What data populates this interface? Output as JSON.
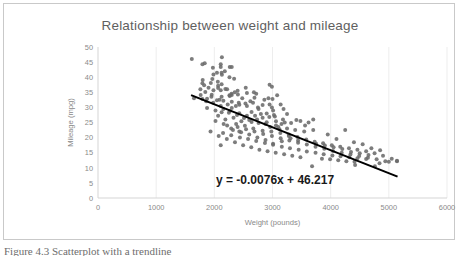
{
  "figure": {
    "caption_clipped": "Figure 4.3  Scatterplot with a trendline",
    "equation_label": "y = -0.0076x + 46.217"
  },
  "chart_data": {
    "type": "scatter",
    "title": "Relationship between weight and mileage",
    "xlabel": "Weight (pounds)",
    "ylabel": "Mileage (mpg)",
    "xlim": [
      0,
      6000
    ],
    "ylim": [
      0,
      50
    ],
    "xticks": [
      0,
      1000,
      2000,
      3000,
      4000,
      5000,
      6000
    ],
    "yticks": [
      0,
      5,
      10,
      15,
      20,
      25,
      30,
      35,
      40,
      45,
      50
    ],
    "grid": "vertical-only",
    "legend": "none",
    "marker_color": "#6b6b6b",
    "trendline": {
      "color": "#000000",
      "slope": -0.0076,
      "intercept": 46.217,
      "x_start": 1600,
      "x_end": 5150,
      "equation": "y = -0.0076x + 46.217"
    },
    "points": [
      [
        1613,
        46
      ],
      [
        2130,
        46.6
      ],
      [
        2110,
        44.3
      ],
      [
        1835,
        44.6
      ],
      [
        2110,
        43.4
      ],
      [
        1975,
        43.1
      ],
      [
        2265,
        43.4
      ],
      [
        1795,
        44.3
      ],
      [
        2045,
        41.5
      ],
      [
        2130,
        40.8
      ],
      [
        1985,
        40.9
      ],
      [
        2125,
        41.5
      ],
      [
        2300,
        43.4
      ],
      [
        1965,
        39.4
      ],
      [
        1800,
        39.1
      ],
      [
        1795,
        38.0
      ],
      [
        1825,
        37.3
      ],
      [
        1940,
        38.1
      ],
      [
        2065,
        37.2
      ],
      [
        2125,
        37.7
      ],
      [
        2190,
        36.1
      ],
      [
        2065,
        36.4
      ],
      [
        1985,
        35.7
      ],
      [
        1845,
        35.1
      ],
      [
        2110,
        35.7
      ],
      [
        2220,
        36.0
      ],
      [
        2295,
        34.5
      ],
      [
        2300,
        34.1
      ],
      [
        2350,
        35.0
      ],
      [
        2405,
        34.3
      ],
      [
        2265,
        33.8
      ],
      [
        2125,
        33.5
      ],
      [
        1955,
        34.2
      ],
      [
        1765,
        34.1
      ],
      [
        1650,
        33.0
      ],
      [
        1795,
        32.8
      ],
      [
        1875,
        32.9
      ],
      [
        2045,
        32.4
      ],
      [
        2155,
        32.2
      ],
      [
        2300,
        31.9
      ],
      [
        2420,
        31.5
      ],
      [
        2535,
        31.3
      ],
      [
        2665,
        31.5
      ],
      [
        2750,
        30.0
      ],
      [
        2560,
        30.5
      ],
      [
        2430,
        30.9
      ],
      [
        2300,
        29.8
      ],
      [
        2155,
        29.5
      ],
      [
        2020,
        29.0
      ],
      [
        1875,
        29.8
      ],
      [
        2125,
        28.4
      ],
      [
        2265,
        28.8
      ],
      [
        2430,
        28.1
      ],
      [
        2560,
        27.2
      ],
      [
        2700,
        27.2
      ],
      [
        2830,
        26.6
      ],
      [
        2945,
        26.8
      ],
      [
        3060,
        25.4
      ],
      [
        2900,
        25.1
      ],
      [
        2735,
        26.0
      ],
      [
        2600,
        25.8
      ],
      [
        2465,
        25.4
      ],
      [
        2330,
        26.6
      ],
      [
        2190,
        26.0
      ],
      [
        2065,
        27.2
      ],
      [
        2220,
        24.0
      ],
      [
        2375,
        24.5
      ],
      [
        2525,
        23.9
      ],
      [
        2670,
        23.0
      ],
      [
        2830,
        22.3
      ],
      [
        2980,
        22.0
      ],
      [
        3135,
        21.5
      ],
      [
        3280,
        21.0
      ],
      [
        3430,
        20.2
      ],
      [
        3580,
        19.4
      ],
      [
        3725,
        18.6
      ],
      [
        3870,
        18.1
      ],
      [
        4020,
        17.5
      ],
      [
        4165,
        17.0
      ],
      [
        4315,
        16.5
      ],
      [
        4460,
        16.0
      ],
      [
        4610,
        15.5
      ],
      [
        4755,
        14.8
      ],
      [
        4900,
        14.0
      ],
      [
        5050,
        13.0
      ],
      [
        5140,
        12.2
      ],
      [
        2400,
        23.5
      ],
      [
        2545,
        22.8
      ],
      [
        2690,
        22.0
      ],
      [
        2840,
        21.2
      ],
      [
        2990,
        20.5
      ],
      [
        3140,
        19.8
      ],
      [
        3290,
        19.0
      ],
      [
        3440,
        18.3
      ],
      [
        3590,
        17.7
      ],
      [
        3740,
        17.0
      ],
      [
        3890,
        16.3
      ],
      [
        4040,
        15.6
      ],
      [
        4190,
        15.0
      ],
      [
        4340,
        14.4
      ],
      [
        4490,
        13.9
      ],
      [
        4640,
        13.3
      ],
      [
        4790,
        12.8
      ],
      [
        4940,
        12.2
      ],
      [
        2990,
        30.0
      ],
      [
        3010,
        29.0
      ],
      [
        3025,
        27.5
      ],
      [
        2950,
        31.0
      ],
      [
        3155,
        24.5
      ],
      [
        3210,
        25.0
      ],
      [
        3060,
        24.0
      ],
      [
        3410,
        25.8
      ],
      [
        3620,
        25.0
      ],
      [
        3560,
        24.0
      ],
      [
        3700,
        22.5
      ],
      [
        3545,
        22.0
      ],
      [
        3390,
        22.5
      ],
      [
        3250,
        23.0
      ],
      [
        3100,
        23.5
      ],
      [
        2880,
        24.5
      ],
      [
        2760,
        24.8
      ],
      [
        2640,
        25.2
      ],
      [
        2510,
        26.5
      ],
      [
        2390,
        27.5
      ],
      [
        2250,
        28.2
      ],
      [
        2110,
        30.5
      ],
      [
        1980,
        31.5
      ],
      [
        1860,
        32.0
      ],
      [
        2150,
        21.5
      ],
      [
        2290,
        20.8
      ],
      [
        2440,
        20.0
      ],
      [
        2580,
        19.5
      ],
      [
        2720,
        18.9
      ],
      [
        2870,
        18.2
      ],
      [
        3010,
        17.6
      ],
      [
        3160,
        17.0
      ],
      [
        3300,
        16.5
      ],
      [
        3450,
        16.0
      ],
      [
        3590,
        15.4
      ],
      [
        3740,
        15.0
      ],
      [
        3880,
        14.5
      ],
      [
        4030,
        14.1
      ],
      [
        4170,
        13.8
      ],
      [
        4320,
        13.5
      ],
      [
        4460,
        13.2
      ],
      [
        4610,
        12.9
      ],
      [
        2110,
        17.5
      ],
      [
        3680,
        10.5
      ],
      [
        4420,
        10.9
      ],
      [
        4760,
        10.5
      ],
      [
        4840,
        11.5
      ],
      [
        5000,
        12.0
      ],
      [
        5140,
        12.3
      ],
      [
        3850,
        13.0
      ],
      [
        3990,
        12.8
      ],
      [
        4130,
        12.5
      ],
      [
        4270,
        12.2
      ],
      [
        4410,
        12.0
      ],
      [
        3480,
        13.5
      ],
      [
        3340,
        14.0
      ],
      [
        3200,
        14.5
      ],
      [
        3055,
        15.0
      ],
      [
        2915,
        15.5
      ],
      [
        2775,
        16.0
      ],
      [
        2635,
        16.8
      ],
      [
        2495,
        17.5
      ],
      [
        2355,
        18.5
      ],
      [
        2215,
        19.5
      ],
      [
        2075,
        20.5
      ],
      [
        1935,
        22.0
      ],
      [
        2480,
        33.0
      ],
      [
        2620,
        32.0
      ],
      [
        2760,
        29.5
      ],
      [
        2900,
        28.0
      ],
      [
        3040,
        27.0
      ],
      [
        3180,
        26.0
      ],
      [
        3320,
        24.8
      ],
      [
        2370,
        30.5
      ],
      [
        2230,
        31.0
      ],
      [
        2090,
        32.5
      ],
      [
        1950,
        33.5
      ],
      [
        2640,
        28.5
      ],
      [
        2800,
        27.8
      ],
      [
        2960,
        23.5
      ],
      [
        3120,
        22.8
      ],
      [
        3280,
        20.5
      ],
      [
        3440,
        19.0
      ],
      [
        2950,
        37.5
      ],
      [
        2990,
        36.8
      ],
      [
        2930,
        33.0
      ],
      [
        3140,
        31.0
      ],
      [
        3190,
        29.5
      ],
      [
        2430,
        22.0
      ],
      [
        2290,
        23.0
      ],
      [
        2160,
        24.5
      ],
      [
        2020,
        25.5
      ],
      [
        2260,
        34.0
      ],
      [
        2400,
        35.5
      ],
      [
        2560,
        34.8
      ],
      [
        2690,
        33.2
      ],
      [
        2830,
        30.8
      ],
      [
        3700,
        26.0
      ],
      [
        3480,
        25.5
      ],
      [
        4250,
        22.5
      ],
      [
        3950,
        21.0
      ],
      [
        4100,
        19.5
      ],
      [
        4400,
        18.5
      ],
      [
        4550,
        17.8
      ],
      [
        4700,
        16.5
      ],
      [
        4850,
        15.8
      ],
      [
        2180,
        42.0
      ],
      [
        2260,
        40.0
      ],
      [
        2340,
        39.5
      ],
      [
        2060,
        38.5
      ],
      [
        1900,
        36.5
      ],
      [
        1760,
        36.0
      ],
      [
        3010,
        18.0
      ],
      [
        3160,
        18.8
      ],
      [
        3310,
        19.8
      ],
      [
        2880,
        19.2
      ],
      [
        2740,
        20.0
      ],
      [
        2600,
        21.0
      ],
      [
        2460,
        21.8
      ],
      [
        2320,
        22.5
      ],
      [
        4350,
        15.2
      ],
      [
        4500,
        14.8
      ],
      [
        4650,
        14.2
      ],
      [
        4200,
        16.2
      ],
      [
        4050,
        16.8
      ],
      [
        3900,
        17.4
      ],
      [
        3750,
        18.0
      ],
      [
        2680,
        35.0
      ],
      [
        2540,
        36.5
      ],
      [
        2720,
        34.5
      ],
      [
        2860,
        32.5
      ],
      [
        3000,
        32.8
      ],
      [
        3080,
        34.0
      ],
      [
        3250,
        27.8
      ]
    ]
  }
}
